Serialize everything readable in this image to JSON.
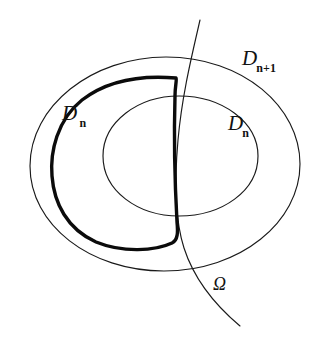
{
  "figure": {
    "name": "nested-domains-diagram",
    "background_color": "#ffffff",
    "stroke_color": "#1a1a1a",
    "bold_stroke_color": "#0b0b0b",
    "width": 329,
    "height": 348,
    "labels": {
      "outer_domain": {
        "main": "D",
        "sub": "n+1",
        "prime": ""
      },
      "inner_domain": {
        "main": "D",
        "sub": "n",
        "prime": ""
      },
      "bold_domain": {
        "main": "D",
        "sub": "n",
        "prime": "′"
      },
      "boundary_curve": {
        "main": "Ω",
        "sub": "",
        "prime": ""
      }
    },
    "shapes": {
      "outer_ellipse": {
        "name": "outer-ellipse",
        "path": "M 30 166 C 30 106 92 57 166 57 C 243 57 300 107 300 164 C 300 222 240 271 164 271 C 90 271 30 225 30 166 Z"
      },
      "inner_ellipse": {
        "name": "inner-ellipse",
        "path": "M 103 156 C 103 122 138 96 179 96 C 222 96 258 122 258 156 C 258 191 222 216 179 216 C 138 216 103 191 103 156 Z"
      },
      "bold_curve": {
        "name": "bold-region-curve",
        "path": "M 176 78 C 141 75 108 80 82 100 C 57 120 50 152 52 176 C 54 203 67 229 96 242 C 123 253 155 251 172 243 C 178 240 178 232 177 222 C 175 186 174 130 175 96 C 175 86 177 80 176 78 Z"
      },
      "omega_curve": {
        "name": "omega-curve",
        "path": "M 200 20 C 192 55 182 95 178 140 C 174 185 175 220 184 248 C 194 279 215 305 240 326"
      }
    }
  }
}
